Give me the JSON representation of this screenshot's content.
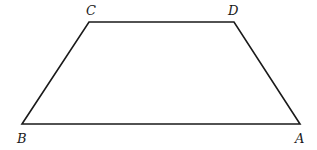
{
  "figure": {
    "type": "trapezoid",
    "vertices": [
      {
        "name": "A",
        "x": 300,
        "y": 124,
        "label_x": 295,
        "label_y": 143
      },
      {
        "name": "B",
        "x": 22,
        "y": 124,
        "label_x": 17,
        "label_y": 143
      },
      {
        "name": "C",
        "x": 89,
        "y": 22,
        "label_x": 86,
        "label_y": 15
      },
      {
        "name": "D",
        "x": 234,
        "y": 22,
        "label_x": 228,
        "label_y": 15
      }
    ],
    "edges": [
      [
        "B",
        "C"
      ],
      [
        "C",
        "D"
      ],
      [
        "D",
        "A"
      ],
      [
        "A",
        "B"
      ]
    ],
    "stroke_color": "#1a1a1a"
  },
  "labels": {
    "A": "A",
    "B": "B",
    "C": "C",
    "D": "D"
  }
}
